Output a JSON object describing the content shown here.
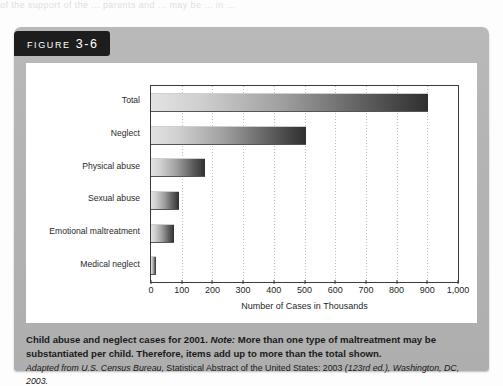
{
  "page": {
    "bleed_text": "of the support of the ... parents and ... may be ... in ..."
  },
  "figure": {
    "tab_label": "Figure 3-6",
    "caption_lead": "Child abuse and neglect cases for 2001.",
    "caption_note_word": "Note:",
    "caption_note_text": " More than one type of maltreatment may be substantiated per child. Therefore, items add up to more than the total shown.",
    "source_italic": "Adapted from U.S. Census Bureau,",
    "source_rest": " Statistical Abstract of the United States: 2003 ",
    "source_ed": "(123rd ed.), Washington, DC, 2003."
  },
  "chart_data": {
    "type": "bar",
    "orientation": "horizontal",
    "title": "",
    "categories": [
      "Total",
      "Neglect",
      "Physical abuse",
      "Sexual abuse",
      "Emotional maltreatment",
      "Medical neglect"
    ],
    "values": [
      903,
      505,
      175,
      90,
      75,
      15
    ],
    "xlabel": "Number of Cases in Thousands",
    "ylabel": "",
    "xlim": [
      0,
      1000
    ],
    "xticks": [
      0,
      100,
      200,
      300,
      400,
      500,
      600,
      700,
      800,
      900,
      1000
    ],
    "xtick_labels": [
      "0",
      "100",
      "200",
      "300",
      "400",
      "500",
      "600",
      "700",
      "800",
      "900",
      "1,000"
    ],
    "grid": "vertical-dotted",
    "legend": "none",
    "bar_gradient_from": "#e3e3e3",
    "bar_gradient_to": "#2f2f2f",
    "panel_color": "#b4b4b4",
    "plot_background": "#ffffff"
  }
}
